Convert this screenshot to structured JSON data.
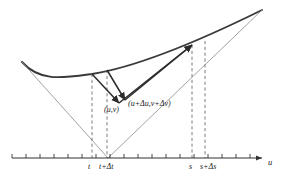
{
  "figure": {
    "type": "geometric-diagram",
    "background_color": "#ffffff",
    "curve_color": "#3a3a3a",
    "line_color": "#8a8a8a",
    "vector_color": "#2b2b2b",
    "dash_color": "#6e6e6e",
    "axis_color": "#333333",
    "text_color": "#1a1a1a"
  },
  "axis": {
    "name": "u",
    "name_x": 268,
    "name_y": 158,
    "y": 158,
    "x_start": 12,
    "x_end": 262,
    "tick_count": 18,
    "tick_spacing": 14,
    "tick_first_x": 12,
    "tick_height": 4
  },
  "tick_labels": [
    {
      "id": "tick-label-t",
      "text": "t",
      "x": 88,
      "y": 163
    },
    {
      "id": "tick-label-t-plus-dt",
      "text": "t+Δt",
      "x": 99,
      "y": 163
    },
    {
      "id": "tick-label-s",
      "text": "s",
      "x": 189,
      "y": 163
    },
    {
      "id": "tick-label-s-plus-ds",
      "text": "s+Δs",
      "x": 200,
      "y": 163
    }
  ],
  "point_labels": [
    {
      "id": "point-label-uv",
      "text": "(u,v)",
      "x": 104,
      "y": 106
    },
    {
      "id": "point-label-dudv",
      "text": "(u+Δu,v+Δv)",
      "x": 128,
      "y": 100
    }
  ],
  "dashed_verticals": [
    {
      "id": "dashed-t",
      "x": 92,
      "y_top": 74,
      "y_bottom": 158
    },
    {
      "id": "dashed-t-plus-dt",
      "x": 107,
      "y_top": 70,
      "y_bottom": 158
    },
    {
      "id": "dashed-s",
      "x": 192,
      "y_top": 45,
      "y_bottom": 158
    },
    {
      "id": "dashed-s-plus-ds",
      "x": 205,
      "y_top": 41,
      "y_bottom": 158
    }
  ],
  "curve": {
    "id": "main-curve",
    "path": "M 22 62 C 40 82, 62 78, 92 74 C 130 68, 185 48, 262 10",
    "stroke_width": 1.9
  },
  "thin_lines": [
    {
      "id": "left-chord",
      "x1": 22,
      "y1": 62,
      "x2": 108,
      "y2": 158
    },
    {
      "id": "right-chord",
      "x1": 108,
      "y1": 158,
      "x2": 262,
      "y2": 10
    }
  ],
  "vectors": [
    {
      "id": "vector-t-down",
      "x1": 92,
      "y1": 74,
      "x2": 119,
      "y2": 103
    },
    {
      "id": "vector-tdt-down",
      "x1": 107,
      "y1": 70,
      "x2": 125,
      "y2": 100
    },
    {
      "id": "vector-up-inner",
      "x1": 119,
      "y1": 103,
      "x2": 192,
      "y2": 45
    },
    {
      "id": "vector-up-outer",
      "x1": 125,
      "y1": 100,
      "x2": 192,
      "y2": 45
    }
  ]
}
